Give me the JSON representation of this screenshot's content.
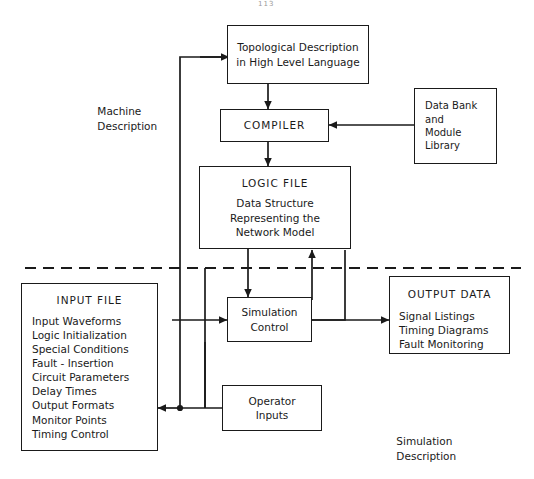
{
  "diagram": {
    "line_color": "#1a1a1a",
    "background": "#ffffff",
    "divider": {
      "style": "dashed",
      "label": "separates machine description from simulation description"
    }
  },
  "nodes": {
    "topological": {
      "lines": [
        "Topological Description",
        "in High Level Language"
      ]
    },
    "compiler": {
      "title": "COMPILER"
    },
    "data_bank": {
      "lines": [
        "Data Bank",
        "and",
        "Module",
        "Library"
      ]
    },
    "logic_file": {
      "title": "LOGIC FILE",
      "lines": [
        "Data Structure",
        "Representing the",
        "Network Model"
      ]
    },
    "input_file": {
      "title": "INPUT FILE",
      "lines": [
        "Input Waveforms",
        "Logic Initialization",
        "Special Conditions",
        "Fault - Insertion",
        "Circuit Parameters",
        "Delay Times",
        "Output Formats",
        "Monitor Points",
        "Timing Control"
      ]
    },
    "simulation_control": {
      "lines": [
        "Simulation",
        "Control"
      ]
    },
    "output_data": {
      "title": "OUTPUT DATA",
      "lines": [
        "Signal Listings",
        "Timing Diagrams",
        "Fault Monitoring"
      ]
    },
    "operator_inputs": {
      "lines": [
        "Operator",
        "Inputs"
      ]
    }
  },
  "labels": {
    "machine_description": [
      "Machine",
      "Description"
    ],
    "simulation_description": [
      "Simulation",
      "Description"
    ],
    "page_mark": "113"
  }
}
